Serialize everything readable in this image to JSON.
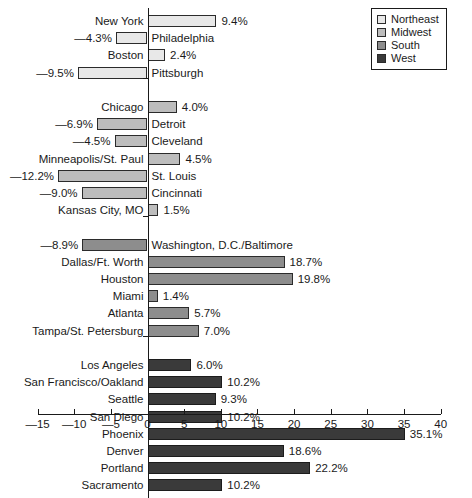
{
  "chart_data": {
    "type": "bar",
    "orientation": "horizontal",
    "title": "",
    "subtitle": "",
    "xlabel": "",
    "ylabel": "",
    "xlim": [
      -15,
      40
    ],
    "xticks": [
      -15,
      -10,
      -5,
      0,
      5,
      10,
      15,
      20,
      25,
      30,
      35,
      40
    ],
    "xtick_labels": [
      "—15",
      "—10",
      "—5",
      "0",
      "5",
      "10",
      "15",
      "20",
      "25",
      "30",
      "35",
      "40"
    ],
    "grid": false,
    "legend_position": "top-right",
    "value_suffix": "%",
    "series": [
      {
        "name": "Northeast",
        "color": "#e8e8e8",
        "categories": [
          "New York",
          "Philadelphia",
          "Boston",
          "Pittsburgh"
        ],
        "values": [
          9.4,
          -4.3,
          2.4,
          -9.5
        ],
        "value_labels": [
          "9.4%",
          "—4.3%",
          "2.4%",
          "—9.5%"
        ]
      },
      {
        "name": "Midwest",
        "color": "#bdbdbd",
        "categories": [
          "Chicago",
          "Detroit",
          "Cleveland",
          "Minneapolis/St. Paul",
          "St. Louis",
          "Cincinnati",
          "Kansas City, MO"
        ],
        "values": [
          4.0,
          -6.9,
          -4.5,
          4.5,
          -12.2,
          -9.0,
          1.5
        ],
        "value_labels": [
          "4.0%",
          "—6.9%",
          "—4.5%",
          "4.5%",
          "—12.2%",
          "—9.0%",
          "1.5%"
        ]
      },
      {
        "name": "South",
        "color": "#8d8d8d",
        "categories": [
          "Washington, D.C./Baltimore",
          "Dallas/Ft. Worth",
          "Houston",
          "Miami",
          "Atlanta",
          "Tampa/St. Petersburg"
        ],
        "values": [
          -8.9,
          18.7,
          19.8,
          1.4,
          5.7,
          7.0
        ],
        "value_labels": [
          "—8.9%",
          "18.7%",
          "19.8%",
          "1.4%",
          "5.7%",
          "7.0%"
        ]
      },
      {
        "name": "West",
        "color": "#3a3a3a",
        "categories": [
          "Los Angeles",
          "San Francisco/Oakland",
          "Seattle",
          "San Diego",
          "Phoenix",
          "Denver",
          "Portland",
          "Sacramento"
        ],
        "values": [
          6.0,
          10.2,
          9.3,
          10.2,
          35.1,
          18.6,
          22.2,
          10.2
        ],
        "value_labels": [
          "6.0%",
          "10.2%",
          "9.3%",
          "10.2%",
          "35.1%",
          "18.6%",
          "22.2%",
          "10.2%"
        ]
      }
    ]
  },
  "legend": {
    "items": [
      {
        "label": "Northeast",
        "color": "#e8e8e8"
      },
      {
        "label": "Midwest",
        "color": "#bdbdbd"
      },
      {
        "label": "South",
        "color": "#8d8d8d"
      },
      {
        "label": "West",
        "color": "#3a3a3a"
      }
    ]
  }
}
